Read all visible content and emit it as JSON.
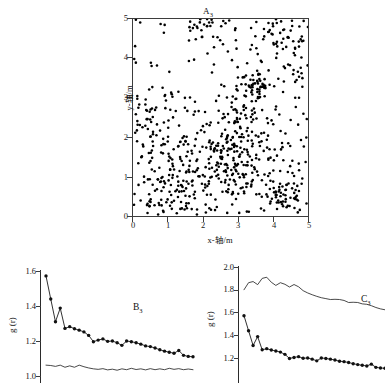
{
  "figure": {
    "background": "#ffffff",
    "ink_color": "#1a1a1a",
    "axis_color": "#3d3d3d"
  },
  "panelA": {
    "tag": "A",
    "tag_sub": "3",
    "title_full": "A3",
    "xlabel": "x-轴/m",
    "ylabel": "y-轴/m",
    "xticks": [
      "0",
      "1",
      "2",
      "3",
      "4",
      "5"
    ],
    "yticks": [
      "0",
      "1",
      "2",
      "3",
      "4",
      "5"
    ],
    "xlim": [
      0,
      5
    ],
    "ylim": [
      0,
      5
    ],
    "marker_color": "#000000",
    "point_count": "820"
  },
  "panelB": {
    "tag": "B",
    "tag_sub": "3",
    "tag_full": "B3",
    "ylabel": "g (r)",
    "ylabel_italic": "r",
    "yticks": [
      "1.0",
      "1.2",
      "1.4",
      "1.6"
    ],
    "ylim": [
      0.98,
      1.63
    ]
  },
  "panelC": {
    "tag": "C",
    "tag_sub": "3",
    "tag_full": "C3",
    "ylabel": "g (r)",
    "ylabel_italic": "r",
    "yticks": [
      "1.2",
      "1.4",
      "1.6",
      "1.8",
      "2.0"
    ],
    "ylim": [
      1.15,
      2.03
    ]
  },
  "chart_data": [
    {
      "id": "A3",
      "type": "scatter",
      "title": "A3",
      "xlabel": "x-轴/m",
      "ylabel": "y-轴/m",
      "xlim": [
        0,
        5
      ],
      "ylim": [
        0,
        5
      ],
      "xticks": [
        0,
        1,
        2,
        3,
        4,
        5
      ],
      "yticks": [
        0,
        1,
        2,
        3,
        4,
        5
      ],
      "grid": false,
      "legend": "none",
      "description": "Spatial point pattern of individual tree stem locations in a 5 m x 5 m plot; clustered aggregation in the lower-central region and around (3.6,3.3) and (4.4,0.5); a conspicuous sparse gap in the upper-left quadrant between x 1-2.5 and y 3.2-4.8.",
      "marker": {
        "shape": "circle",
        "size_px": 2.6,
        "color": "#000000"
      },
      "n_points": 820,
      "clusters": [
        {
          "cx": 2.85,
          "cy": 1.35,
          "n": 150,
          "sd": 0.55
        },
        {
          "cx": 3.6,
          "cy": 3.28,
          "n": 40,
          "sd": 0.17
        },
        {
          "cx": 4.4,
          "cy": 0.55,
          "n": 55,
          "sd": 0.3
        },
        {
          "cx": 1.15,
          "cy": 1.05,
          "n": 95,
          "sd": 0.55
        },
        {
          "cx": 4.15,
          "cy": 4.45,
          "n": 60,
          "sd": 0.55
        },
        {
          "cx": 0.55,
          "cy": 2.55,
          "n": 45,
          "sd": 0.45
        },
        {
          "cx": 3.15,
          "cy": 2.55,
          "n": 55,
          "sd": 0.5
        },
        {
          "cx": 2.2,
          "cy": 4.75,
          "n": 45,
          "sd": 0.35
        }
      ],
      "uniform_background_n": 275
    },
    {
      "id": "B3",
      "type": "line",
      "title": "B3",
      "xlabel": "",
      "ylabel": "g (r)",
      "ylim": [
        0.98,
        1.63
      ],
      "yticks": [
        1.0,
        1.2,
        1.4,
        1.6
      ],
      "grid": false,
      "legend": "none",
      "series": [
        {
          "name": "g(r) observed",
          "marker": "filled-circle",
          "x": [
            1,
            2,
            3,
            4,
            5,
            6,
            7,
            8,
            9,
            10,
            11,
            12,
            13,
            14,
            15,
            16,
            17,
            18,
            19,
            20,
            21,
            22,
            23,
            24,
            25,
            26,
            27,
            28,
            29,
            30,
            31,
            32
          ],
          "values": [
            1.572,
            1.44,
            1.31,
            1.388,
            1.272,
            1.282,
            1.27,
            1.262,
            1.252,
            1.232,
            1.196,
            1.205,
            1.212,
            1.198,
            1.2,
            1.19,
            1.175,
            1.2,
            1.196,
            1.19,
            1.182,
            1.172,
            1.168,
            1.16,
            1.15,
            1.142,
            1.136,
            1.13,
            1.146,
            1.118,
            1.112,
            1.11
          ]
        },
        {
          "name": "envelope lower",
          "marker": "none",
          "x": [
            1,
            2,
            3,
            4,
            5,
            6,
            7,
            8,
            9,
            10,
            11,
            12,
            13,
            14,
            15,
            16,
            17,
            18,
            19,
            20,
            21,
            22,
            23,
            24,
            25,
            26,
            27,
            28,
            29,
            30,
            31,
            32
          ],
          "values": [
            1.062,
            1.06,
            1.055,
            1.062,
            1.05,
            1.058,
            1.05,
            1.062,
            1.053,
            1.046,
            1.041,
            1.038,
            1.042,
            1.035,
            1.039,
            1.033,
            1.041,
            1.036,
            1.044,
            1.037,
            1.041,
            1.035,
            1.042,
            1.036,
            1.041,
            1.036,
            1.044,
            1.038,
            1.042,
            1.036,
            1.04,
            1.036
          ]
        }
      ]
    },
    {
      "id": "C3",
      "type": "line",
      "title": "C3",
      "xlabel": "",
      "ylabel": "g (r)",
      "ylim": [
        1.15,
        2.03
      ],
      "yticks": [
        1.2,
        1.4,
        1.6,
        1.8,
        2.0
      ],
      "grid": false,
      "legend": "none",
      "series": [
        {
          "name": "g(r) observed",
          "marker": "filled-circle",
          "x": [
            1,
            2,
            3,
            4,
            5,
            6,
            7,
            8,
            9,
            10,
            11,
            12,
            13,
            14,
            15,
            16,
            17,
            18,
            19,
            20,
            21,
            22,
            23,
            24,
            25,
            26,
            27,
            28,
            29,
            30,
            31,
            32
          ],
          "values": [
            1.572,
            1.44,
            1.31,
            1.388,
            1.272,
            1.282,
            1.27,
            1.262,
            1.252,
            1.232,
            1.196,
            1.205,
            1.212,
            1.198,
            1.2,
            1.19,
            1.175,
            1.2,
            1.196,
            1.19,
            1.182,
            1.172,
            1.168,
            1.16,
            1.15,
            1.142,
            1.136,
            1.13,
            1.146,
            1.118,
            1.112,
            1.11
          ]
        },
        {
          "name": "envelope upper",
          "marker": "none",
          "x": [
            1,
            2,
            3,
            4,
            5,
            6,
            7,
            8,
            9,
            10,
            11,
            12,
            13,
            14,
            15,
            16,
            17,
            18,
            19,
            20,
            21,
            22,
            23,
            24,
            25,
            26,
            27,
            28,
            29,
            30,
            31,
            32
          ],
          "values": [
            1.8,
            1.862,
            1.872,
            1.845,
            1.9,
            1.91,
            1.866,
            1.838,
            1.862,
            1.848,
            1.824,
            1.846,
            1.826,
            1.792,
            1.772,
            1.756,
            1.742,
            1.73,
            1.722,
            1.714,
            1.716,
            1.714,
            1.706,
            1.688,
            1.69,
            1.688,
            1.676,
            1.672,
            1.66,
            1.644,
            1.632,
            1.624
          ]
        }
      ]
    }
  ]
}
